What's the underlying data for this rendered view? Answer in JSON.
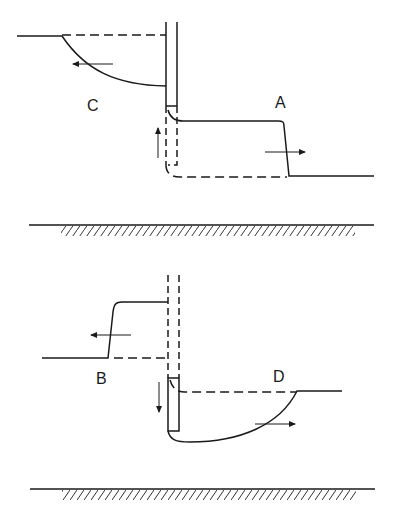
{
  "diagram": {
    "type": "retaining-wall earth pressure states",
    "labels": {
      "A": "A",
      "B": "B",
      "C": "C",
      "D": "D"
    },
    "colors": {
      "line": "#1a1a1a",
      "background": "#ffffff"
    },
    "panels": [
      {
        "name": "upper",
        "cases": [
          "C",
          "A"
        ],
        "wall_movement": "up"
      },
      {
        "name": "lower",
        "cases": [
          "B",
          "D"
        ],
        "wall_movement": "down"
      }
    ]
  }
}
